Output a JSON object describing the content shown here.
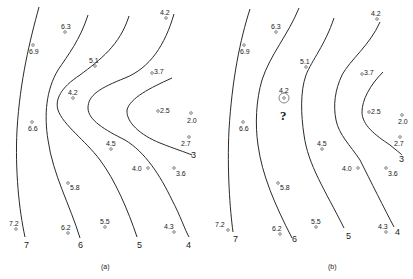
{
  "panels": [
    {
      "caption": "(a)",
      "contour_labels": [
        "7",
        "6",
        "5",
        "4",
        "3"
      ],
      "points": [
        {
          "v": "6.3"
        },
        {
          "v": "6.9"
        },
        {
          "v": "5.1"
        },
        {
          "v": "4.2"
        },
        {
          "v": "3.7"
        },
        {
          "v": "4.2"
        },
        {
          "v": "2.5"
        },
        {
          "v": "2.0"
        },
        {
          "v": "6.6"
        },
        {
          "v": "2.7"
        },
        {
          "v": "4.5"
        },
        {
          "v": "4.0"
        },
        {
          "v": "3.6"
        },
        {
          "v": "5.8"
        },
        {
          "v": "7.2"
        },
        {
          "v": "6.2"
        },
        {
          "v": "5.5"
        },
        {
          "v": "4.3"
        }
      ]
    },
    {
      "caption": "(b)",
      "contour_labels": [
        "7",
        "6",
        "5",
        "4",
        "3"
      ],
      "question_mark": "?",
      "points": [
        {
          "v": "6.3"
        },
        {
          "v": "6.9"
        },
        {
          "v": "5.1"
        },
        {
          "v": "4.2"
        },
        {
          "v": "3.7"
        },
        {
          "v": "4.2"
        },
        {
          "v": "2.5"
        },
        {
          "v": "2.0"
        },
        {
          "v": "6.6"
        },
        {
          "v": "2.7"
        },
        {
          "v": "4.5"
        },
        {
          "v": "4.0"
        },
        {
          "v": "3.6"
        },
        {
          "v": "5.8"
        },
        {
          "v": "7.2"
        },
        {
          "v": "6.2"
        },
        {
          "v": "5.5"
        },
        {
          "v": "4.3"
        }
      ]
    }
  ]
}
